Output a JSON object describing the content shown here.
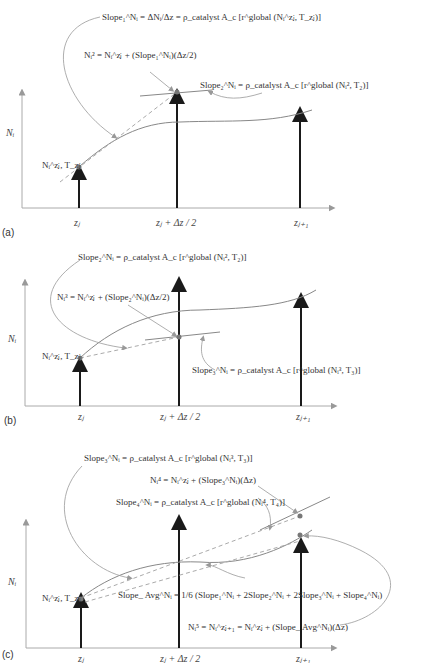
{
  "panels": [
    {
      "id": "a",
      "label": "(a)",
      "y_axis_label": "Nᵢ",
      "x_ticks": [
        "zⱼ",
        "zⱼ + Δz / 2",
        "zⱼ₊₁"
      ],
      "start_point_label": "Nᵢ^zⱼ, T_zⱼ",
      "equations": [
        "Slope₁^Nᵢ = ΔNᵢ/Δz = ρ_catalyst A_c [r^global (Nᵢ^zⱼ, T_zⱼ)]",
        "Nᵢ² = Nᵢ^zⱼ + (Slope₁^Nᵢ)(Δz/2)",
        "Slope₂^Nᵢ = ρ_catalyst A_c [r^global (Nᵢ², T₂)]"
      ]
    },
    {
      "id": "b",
      "label": "(b)",
      "y_axis_label": "Nᵢ",
      "x_ticks": [
        "zⱼ",
        "zⱼ + Δz / 2",
        "zⱼ₊₁"
      ],
      "start_point_label": "Nᵢ^zⱼ, T_zⱼ",
      "equations": [
        "Slope₂^Nᵢ = ρ_catalyst A_c [r^global (Nᵢ², T₂)]",
        "Nᵢ³ = Nᵢ^zⱼ + (Slope₂^Nᵢ)(Δz/2)",
        "Slope₃^Nᵢ = ρ_catalyst A_c [r^global (Nᵢ³, T₃)]"
      ]
    },
    {
      "id": "c",
      "label": "(c)",
      "y_axis_label": "Nᵢ",
      "x_ticks": [
        "zⱼ",
        "zⱼ + Δz / 2",
        "zⱼ₊₁"
      ],
      "start_point_label": "Nᵢ^zⱼ, T_zⱼ",
      "equations": [
        "Slope₃^Nᵢ = ρ_catalyst A_c [r^global (Nᵢ³, T₃)]",
        "Nᵢ⁴ = Nᵢ^zⱼ + (Slope₃^Nᵢ)(Δz)",
        "Slope₄^Nᵢ = ρ_catalyst A_c [r^global (Nᵢ⁴, T₄)]",
        "Slope_ Avg^Nᵢ = 1/6 (Slope₁^Nᵢ + 2Slope₂^Nᵢ + 2Slope₃^Nᵢ + Slope₄^Nᵢ)",
        "Nᵢ⁵ = Nᵢ^zⱼ₊₁ = Nᵢ^zⱼ + (Slope_ Avg^Nᵢ)(Δz)"
      ]
    }
  ],
  "colors": {
    "curve": "#8a8a8a",
    "arrow": "#1a1a1a",
    "axis": "#9a9a9a",
    "text": "#333333"
  }
}
